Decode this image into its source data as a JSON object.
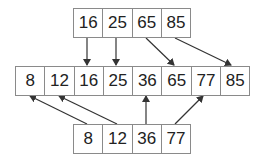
{
  "rows": {
    "top": [
      "16",
      "25",
      "65",
      "85"
    ],
    "middle": [
      "8",
      "12",
      "16",
      "25",
      "36",
      "65",
      "77",
      "85"
    ],
    "bottom": [
      "8",
      "12",
      "36",
      "77"
    ]
  },
  "arrows": [
    {
      "from": "top.16",
      "to": "middle.16"
    },
    {
      "from": "top.25",
      "to": "middle.25"
    },
    {
      "from": "top.65",
      "to": "middle.65"
    },
    {
      "from": "top.85",
      "to": "middle.85"
    },
    {
      "from": "bottom.8",
      "to": "middle.8"
    },
    {
      "from": "bottom.12",
      "to": "middle.12"
    },
    {
      "from": "bottom.36",
      "to": "middle.36"
    },
    {
      "from": "bottom.77",
      "to": "middle.77"
    }
  ],
  "colors": {
    "border": "#8a8a8a",
    "arrow": "#333333",
    "text": "#222222"
  }
}
